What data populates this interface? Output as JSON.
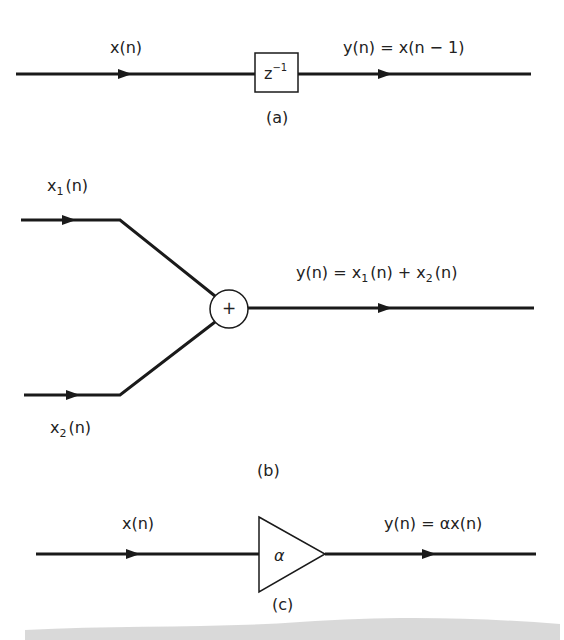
{
  "diagrams": {
    "a": {
      "caption": "(a)",
      "input_label": "x(n)",
      "output_label": "y(n) = x(n − 1)",
      "block_label": "z",
      "block_exponent": "−1",
      "block_type": "unit-delay"
    },
    "b": {
      "caption": "(b)",
      "input1_label_base": "x",
      "input1_label_sub": "1",
      "input1_label_arg": "(n)",
      "input2_label_base": "x",
      "input2_label_sub": "2",
      "input2_label_arg": "(n)",
      "output_label_prefix": "y(n) = x",
      "output_sub1": "1",
      "output_mid": "(n) + x",
      "output_sub2": "2",
      "output_suffix": "(n)",
      "adder_symbol": "+",
      "block_type": "adder"
    },
    "c": {
      "caption": "(c)",
      "input_label": "x(n)",
      "output_label": "y(n) = αx(n)",
      "gain_symbol": "α",
      "block_type": "constant-multiplier"
    }
  },
  "colors": {
    "line": "#1a1a1a",
    "background": "#ffffff",
    "smudge": "#c8c8c8"
  }
}
